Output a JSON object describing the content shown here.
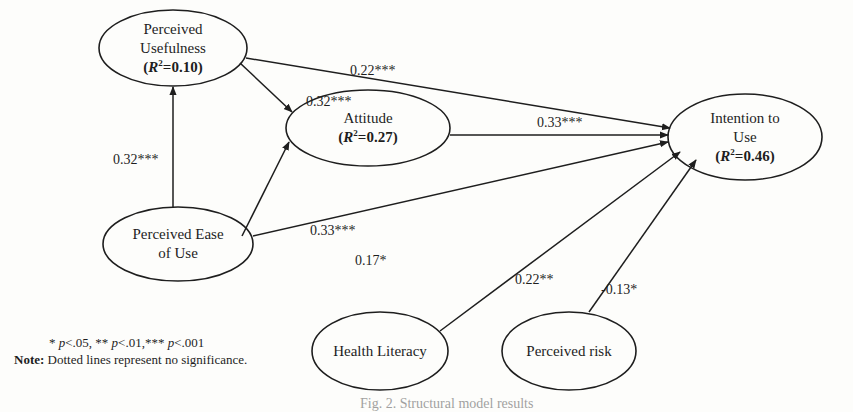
{
  "figure": {
    "caption": "Fig. 2. Structural model results"
  },
  "nodes": [
    {
      "id": "pu",
      "lines": [
        "Perceived",
        "Usefulness"
      ],
      "r2": "0.10",
      "cx": 173,
      "cy": 48,
      "rx": 74,
      "ry": 38
    },
    {
      "id": "att",
      "lines": [
        "Attitude"
      ],
      "r2": "0.27",
      "cx": 368,
      "cy": 128,
      "rx": 82,
      "ry": 38
    },
    {
      "id": "itu",
      "lines": [
        "Intention to",
        "Use"
      ],
      "r2": "0.46",
      "cx": 745,
      "cy": 137,
      "rx": 77,
      "ry": 43
    },
    {
      "id": "peou",
      "lines": [
        "Perceived Ease",
        "of Use"
      ],
      "r2": null,
      "cx": 178,
      "cy": 244,
      "rx": 75,
      "ry": 37
    },
    {
      "id": "hl",
      "lines": [
        "Health Literacy"
      ],
      "r2": null,
      "cx": 380,
      "cy": 351,
      "rx": 68,
      "ry": 39
    },
    {
      "id": "pr",
      "lines": [
        "Perceived risk"
      ],
      "r2": null,
      "cx": 569,
      "cy": 351,
      "rx": 67,
      "ry": 39
    }
  ],
  "paths": [
    {
      "from": "peou",
      "to": "pu",
      "coef": "0.32***"
    },
    {
      "from": "pu",
      "to": "att",
      "coef": "0.32***"
    },
    {
      "from": "pu",
      "to": "itu",
      "coef": "0.22***"
    },
    {
      "from": "att",
      "to": "itu",
      "coef": "0.33***"
    },
    {
      "from": "peou",
      "to": "att",
      "coef": "0.33***"
    },
    {
      "from": "peou",
      "to": "itu",
      "coef": "0.17*"
    },
    {
      "from": "hl",
      "to": "itu",
      "coef": "0.22**"
    },
    {
      "from": "pr",
      "to": "itu",
      "coef": "-0.13*"
    }
  ],
  "legend": {
    "significance": {
      "star1": "* ",
      "p1": "p",
      "v1": "<.05, ",
      "star2": "** ",
      "p2": "p",
      "v2": "<.01,",
      "star3": "*** ",
      "p3": "p",
      "v3": "<.001"
    },
    "note_label": "Note:",
    "note_text": " Dotted lines represent no significance."
  },
  "r2_prefix": "(",
  "r2_symbol": "R",
  "r2_sup": "2",
  "r2_eq": "=",
  "r2_suffix": ")"
}
